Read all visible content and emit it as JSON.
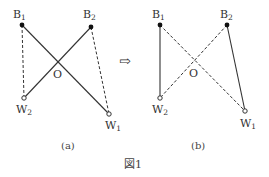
{
  "figure": {
    "caption": "図1",
    "arrow": "⇨",
    "panels": [
      {
        "id": "a",
        "label": "(a)",
        "points": {
          "B1": {
            "label": "B",
            "sub": "1",
            "type": "filled"
          },
          "B2": {
            "label": "B",
            "sub": "2",
            "type": "filled"
          },
          "W1": {
            "label": "W",
            "sub": "1",
            "type": "open"
          },
          "W2": {
            "label": "W",
            "sub": "2",
            "type": "open"
          },
          "O": {
            "label": "O"
          }
        },
        "edges": [
          {
            "from": "B1",
            "to": "W1",
            "style": "solid"
          },
          {
            "from": "B2",
            "to": "W2",
            "style": "solid"
          },
          {
            "from": "B1",
            "to": "W2",
            "style": "dashed"
          },
          {
            "from": "B2",
            "to": "W1",
            "style": "dashed"
          }
        ]
      },
      {
        "id": "b",
        "label": "(b)",
        "points": {
          "B1": {
            "label": "B",
            "sub": "1",
            "type": "filled"
          },
          "B2": {
            "label": "B",
            "sub": "2",
            "type": "filled"
          },
          "W1": {
            "label": "W",
            "sub": "1",
            "type": "open"
          },
          "W2": {
            "label": "W",
            "sub": "2",
            "type": "open"
          },
          "O": {
            "label": "O"
          }
        },
        "edges": [
          {
            "from": "B1",
            "to": "W2",
            "style": "solid"
          },
          {
            "from": "B2",
            "to": "W1",
            "style": "solid"
          },
          {
            "from": "B1",
            "to": "W1",
            "style": "dashed"
          },
          {
            "from": "B2",
            "to": "W2",
            "style": "dashed"
          }
        ]
      }
    ]
  }
}
